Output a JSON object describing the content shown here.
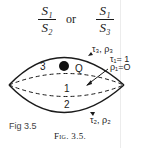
{
  "formula": {
    "left": {
      "numerator": "S₁",
      "denominator": "S₂"
    },
    "connector": "or",
    "right": {
      "numerator": "S₁",
      "denominator": "S₃"
    }
  },
  "diagram": {
    "regions": {
      "region_3": "3",
      "region_1": "1",
      "region_2": "2"
    },
    "point_label": "Q",
    "upper_surface_label": "τ₃, ρ₃",
    "lower_surface_label": "τ₂, ρ₂",
    "inner_label_tau": "τ₁= 1",
    "inner_label_rho": "ρ₁=O"
  },
  "captions": {
    "handwritten": "Fig 3.5",
    "printed": "Fig. 3.5."
  }
}
